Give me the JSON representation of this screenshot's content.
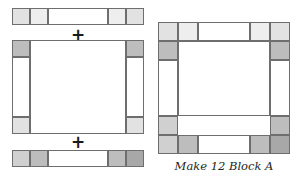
{
  "diagram": {
    "type": "quilt-block-assembly",
    "caption": "Make 12 Block A",
    "operators": [
      "+",
      "+"
    ],
    "palette": {
      "white": "#ffffff",
      "very_light_gray": "#eeeeee",
      "light_gray": "#e2e2e2",
      "medium_light_gray": "#d0d0d0",
      "medium_gray": "#bdbdbd",
      "dark_gray": "#a8a8a8",
      "outline": "#6e6e6e"
    },
    "units": [
      {
        "name": "top-sashing-strip",
        "role": "top strip",
        "segments": [
          {
            "label": "corner square",
            "shade": "light_gray"
          },
          {
            "label": "corner square",
            "shade": "very_light_gray"
          },
          {
            "label": "sashing rectangle",
            "shade": "white"
          },
          {
            "label": "corner square",
            "shade": "very_light_gray"
          },
          {
            "label": "corner square",
            "shade": "light_gray"
          }
        ]
      },
      {
        "name": "center-unit",
        "role": "center with side strips",
        "segments": [
          {
            "label": "left top square",
            "shade": "medium_gray"
          },
          {
            "label": "left sashing rectangle",
            "shade": "white"
          },
          {
            "label": "left bottom square",
            "shade": "light_gray"
          },
          {
            "label": "center square",
            "shade": "white"
          },
          {
            "label": "right top square",
            "shade": "medium_gray"
          },
          {
            "label": "right sashing rectangle",
            "shade": "white"
          },
          {
            "label": "right bottom square",
            "shade": "light_gray"
          }
        ]
      },
      {
        "name": "bottom-sashing-strip",
        "role": "bottom strip",
        "segments": [
          {
            "label": "corner square",
            "shade": "medium_light_gray"
          },
          {
            "label": "corner square",
            "shade": "medium_gray"
          },
          {
            "label": "sashing rectangle",
            "shade": "white"
          },
          {
            "label": "corner square",
            "shade": "medium_gray"
          },
          {
            "label": "corner square",
            "shade": "dark_gray"
          }
        ]
      },
      {
        "name": "finished-block",
        "role": "assembled Block A",
        "segments": [
          {
            "label": "top-left outer square",
            "shade": "light_gray"
          },
          {
            "label": "top-left inner square",
            "shade": "very_light_gray"
          },
          {
            "label": "top sashing rectangle",
            "shade": "white"
          },
          {
            "label": "top-right inner square",
            "shade": "very_light_gray"
          },
          {
            "label": "top-right outer square",
            "shade": "light_gray"
          },
          {
            "label": "upper-left corner square",
            "shade": "medium_gray"
          },
          {
            "label": "upper-right corner square",
            "shade": "medium_gray"
          },
          {
            "label": "left sashing rectangle",
            "shade": "white"
          },
          {
            "label": "center square",
            "shade": "white"
          },
          {
            "label": "right sashing rectangle",
            "shade": "white"
          },
          {
            "label": "lower-left corner square",
            "shade": "medium_light_gray"
          },
          {
            "label": "lower-right corner square",
            "shade": "medium_gray"
          },
          {
            "label": "bottom-left outer square",
            "shade": "medium_light_gray"
          },
          {
            "label": "bottom-left inner square",
            "shade": "medium_gray"
          },
          {
            "label": "bottom sashing rectangle",
            "shade": "white"
          },
          {
            "label": "bottom-right inner square",
            "shade": "medium_gray"
          },
          {
            "label": "bottom-right outer square",
            "shade": "dark_gray"
          }
        ]
      }
    ]
  }
}
